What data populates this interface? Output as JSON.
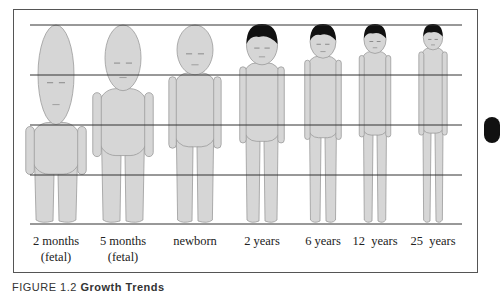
{
  "figure": {
    "grid_lines_y": [
      25,
      75,
      125,
      175,
      224
    ],
    "colors": {
      "skin": "#d6d6d6",
      "outline": "#9a9a9a",
      "hair": "#111111",
      "line": "#333333",
      "frame": "#555555"
    },
    "stages": [
      {
        "label_line1": "2 months",
        "label_line2": "(fetal)",
        "cx": 56,
        "head_h": 0.5,
        "hair": false
      },
      {
        "label_line1": "5 months",
        "label_line2": "(fetal)",
        "cx": 123,
        "head_h": 0.33,
        "hair": false
      },
      {
        "label_line1": "newborn",
        "label_line2": "",
        "cx": 195,
        "head_h": 0.25,
        "hair": false
      },
      {
        "label_line1": "2 years",
        "label_line2": "",
        "cx": 262,
        "head_h": 0.2,
        "hair": true
      },
      {
        "label_line1": "6 years",
        "label_line2": "",
        "cx": 323,
        "head_h": 0.167,
        "hair": true
      },
      {
        "label_line1": "12  years",
        "label_line2": "",
        "cx": 375,
        "head_h": 0.143,
        "hair": true
      },
      {
        "label_line1": "25  years",
        "label_line2": "",
        "cx": 433,
        "head_h": 0.125,
        "hair": true
      }
    ]
  },
  "caption": {
    "prefix": "FIGURE 1.2",
    "title": "Growth Trends"
  }
}
